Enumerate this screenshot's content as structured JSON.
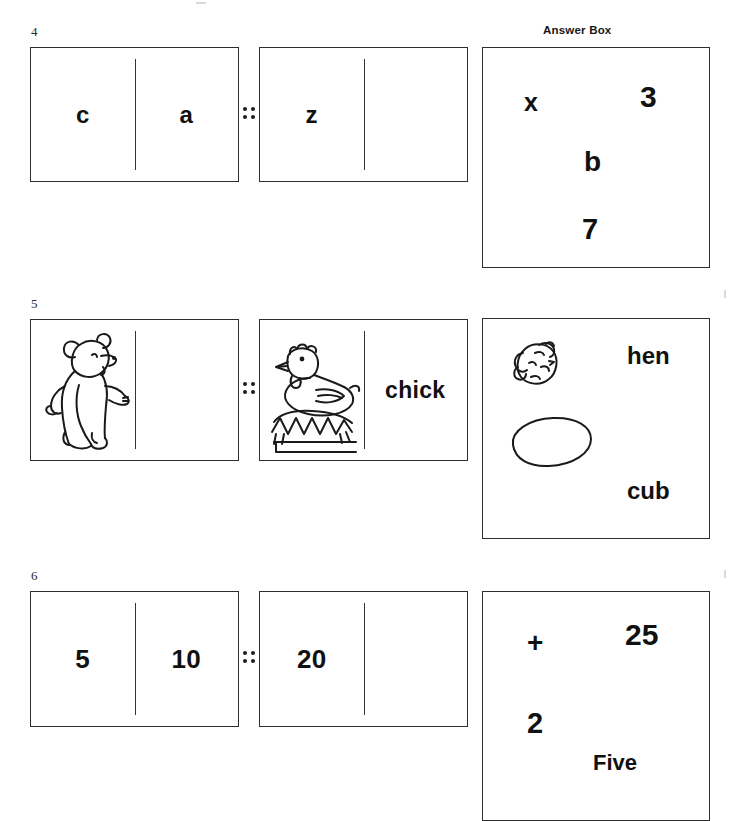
{
  "worksheet": {
    "answer_box_label": "Answer Box",
    "proportion_symbol": "::"
  },
  "rows": [
    {
      "number": "4",
      "term_a": {
        "left": "c",
        "right": "a"
      },
      "term_b": {
        "left": "z",
        "right": ""
      },
      "answers": [
        {
          "label": "x"
        },
        {
          "label": "3"
        },
        {
          "label": "b"
        },
        {
          "label": "7"
        }
      ]
    },
    {
      "number": "5",
      "term_a": {
        "left": "bear-picture",
        "right": ""
      },
      "term_b": {
        "left": "hen-on-nest-picture",
        "right": "chick"
      },
      "answers": [
        {
          "label": "chick-picture"
        },
        {
          "label": "hen"
        },
        {
          "label": "egg-picture"
        },
        {
          "label": "cub"
        }
      ]
    },
    {
      "number": "6",
      "term_a": {
        "left": "5",
        "right": "10"
      },
      "term_b": {
        "left": "20",
        "right": ""
      },
      "answers": [
        {
          "label": "+"
        },
        {
          "label": "25"
        },
        {
          "label": "2"
        },
        {
          "label": "Five"
        }
      ]
    }
  ]
}
